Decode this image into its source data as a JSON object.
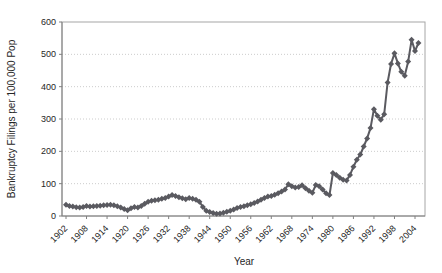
{
  "chart_data": {
    "type": "line",
    "title": "",
    "xlabel": "Year",
    "ylabel": "Bankruptcy Filings per 100,000 Pop",
    "legend": "none",
    "grid": "horizontal-dotted",
    "marker": "diamond",
    "ylim": [
      0,
      600
    ],
    "yticks": [
      0,
      100,
      200,
      300,
      400,
      500,
      600
    ],
    "xtick_labels": [
      "1902",
      "1908",
      "1914",
      "1920",
      "1926",
      "1932",
      "1938",
      "1944",
      "1950",
      "1956",
      "1962",
      "1968",
      "1974",
      "1980",
      "1986",
      "1992",
      "1998",
      "2004"
    ],
    "x": [
      1902,
      1903,
      1904,
      1905,
      1906,
      1907,
      1908,
      1909,
      1910,
      1911,
      1912,
      1913,
      1914,
      1915,
      1916,
      1917,
      1918,
      1919,
      1920,
      1921,
      1922,
      1923,
      1924,
      1925,
      1926,
      1927,
      1928,
      1929,
      1930,
      1931,
      1932,
      1933,
      1934,
      1935,
      1936,
      1937,
      1938,
      1939,
      1940,
      1941,
      1942,
      1943,
      1944,
      1945,
      1946,
      1947,
      1948,
      1949,
      1950,
      1951,
      1952,
      1953,
      1954,
      1955,
      1956,
      1957,
      1958,
      1959,
      1960,
      1961,
      1962,
      1963,
      1964,
      1965,
      1966,
      1967,
      1968,
      1969,
      1970,
      1971,
      1972,
      1973,
      1974,
      1975,
      1976,
      1977,
      1978,
      1979,
      1980,
      1981,
      1982,
      1983,
      1984,
      1985,
      1986,
      1987,
      1988,
      1989,
      1990,
      1991,
      1992,
      1993,
      1994,
      1995,
      1996,
      1997,
      1998,
      1999,
      2000,
      2001,
      2002,
      2003,
      2004,
      2005
    ],
    "values": [
      35,
      31,
      29,
      27,
      26,
      28,
      31,
      29,
      30,
      31,
      32,
      33,
      34,
      35,
      33,
      30,
      26,
      22,
      18,
      24,
      28,
      26,
      31,
      38,
      44,
      47,
      49,
      50,
      53,
      56,
      60,
      65,
      62,
      58,
      55,
      52,
      56,
      53,
      50,
      44,
      28,
      16,
      12,
      9,
      7,
      8,
      10,
      13,
      16,
      20,
      25,
      28,
      30,
      33,
      36,
      40,
      45,
      50,
      56,
      60,
      62,
      66,
      70,
      76,
      82,
      98,
      92,
      88,
      90,
      95,
      86,
      78,
      72,
      96,
      92,
      82,
      70,
      65,
      133,
      127,
      118,
      112,
      110,
      127,
      152,
      174,
      190,
      215,
      240,
      272,
      330,
      310,
      298,
      315,
      413,
      470,
      503,
      472,
      446,
      434,
      478,
      545,
      510,
      535
    ],
    "colors": {
      "line": "#5a5a60",
      "marker": "#5a5a60",
      "grid": "#cccccc",
      "plot_border": "#a6a6a6",
      "axis": "#808080",
      "text": "#262626"
    }
  }
}
